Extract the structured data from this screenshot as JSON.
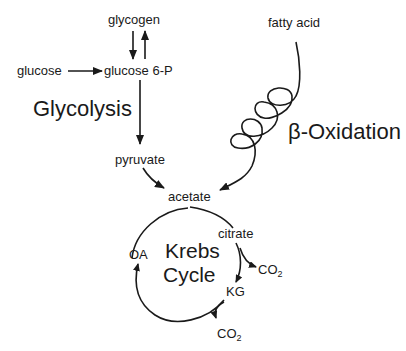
{
  "diagram": {
    "nodes": {
      "glycogen": "glycogen",
      "glucose": "glucose",
      "glucose6p": "glucose 6-P",
      "pyruvate": "pyruvate",
      "fatty_acid": "fatty acid",
      "acetate": "acetate",
      "citrate": "citrate",
      "kg": "KG",
      "oa": "OA",
      "co2_1": "CO",
      "co2_1_sub": "2",
      "co2_2": "CO",
      "co2_2_sub": "2"
    },
    "pathways": {
      "glycolysis": "Glycolysis",
      "beta_oxidation": "β-Oxidation",
      "krebs_line1": "Krebs",
      "krebs_line2": "Cycle"
    },
    "edges": [
      {
        "from": "glycogen",
        "to": "glucose 6-P"
      },
      {
        "from": "glucose 6-P",
        "to": "glycogen"
      },
      {
        "from": "glucose",
        "to": "glucose 6-P"
      },
      {
        "from": "glucose 6-P",
        "to": "pyruvate"
      },
      {
        "from": "pyruvate",
        "to": "acetate"
      },
      {
        "from": "fatty acid",
        "to": "acetate",
        "style": "coil"
      },
      {
        "from": "acetate",
        "to": "citrate"
      },
      {
        "from": "citrate",
        "to": "KG"
      },
      {
        "from": "citrate",
        "to": "CO2"
      },
      {
        "from": "KG",
        "to": "OA"
      },
      {
        "from": "KG",
        "to": "CO2"
      },
      {
        "from": "OA",
        "to": "acetate"
      }
    ],
    "colors": {
      "ink": "#1a1a1a",
      "background": "#ffffff"
    }
  }
}
